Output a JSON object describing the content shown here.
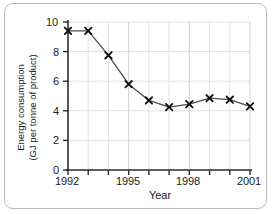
{
  "chart_data": {
    "type": "line",
    "title": "",
    "xlabel": "Year",
    "ylabel": "Energy consumption\n(GJ per tonne of product)",
    "ylabel_line1": "Energy consumption",
    "ylabel_line2": "(GJ per tonne of product)",
    "x": [
      1992,
      1993,
      1994,
      1995,
      1996,
      1997,
      1998,
      1999,
      2000,
      2001
    ],
    "values": [
      9.4,
      9.4,
      7.75,
      5.8,
      4.7,
      4.25,
      4.45,
      4.85,
      4.75,
      4.3
    ],
    "series": [
      {
        "name": "Energy consumption",
        "values": [
          9.4,
          9.4,
          7.75,
          5.8,
          4.7,
          4.25,
          4.45,
          4.85,
          4.75,
          4.3
        ]
      }
    ],
    "xlim": [
      1992,
      2001
    ],
    "ylim": [
      0,
      10
    ],
    "ytick_labels": [
      "0",
      "2",
      "4",
      "6",
      "8",
      "10"
    ],
    "ytick_values": [
      0,
      2,
      4,
      6,
      8,
      10
    ],
    "xtick_labels": [
      "1992",
      "1995",
      "1998",
      "2001"
    ],
    "xtick_values": [
      1992,
      1995,
      1998,
      2001
    ],
    "xtick_minor_values": [
      1993,
      1994,
      1996,
      1997,
      1999,
      2000
    ],
    "grid": true,
    "legend": null,
    "marker": "x",
    "line_color": "#4d4d4d",
    "marker_color": "#111111",
    "grid_color": "#e2e2e2",
    "axis_color": "#2b2b2b",
    "plot_background": "#ffffff"
  },
  "figure": {
    "border_color": "#b9b9b9",
    "background": "#ffffff"
  }
}
